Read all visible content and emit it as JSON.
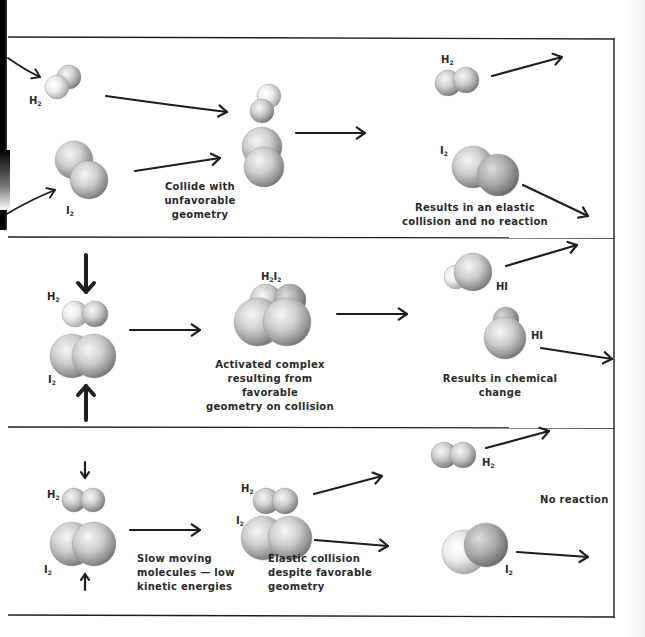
{
  "panels": [
    {
      "id": "unfavorable-geometry",
      "reactants": [
        "H2",
        "I2"
      ],
      "collision_caption": "Collide with\nunfavorable geometry",
      "result_caption": "Results in an elastic\ncollision and no reaction",
      "products": [
        "H2",
        "I2"
      ]
    },
    {
      "id": "favorable-geometry",
      "reactants": [
        "H2",
        "I2"
      ],
      "complex_label": "H2I2",
      "collision_caption": "Activated complex\nresulting from favorable\ngeometry on collision",
      "result_caption": "Results in chemical\nchange",
      "products": [
        "HI",
        "HI"
      ]
    },
    {
      "id": "low-kinetic-energy",
      "reactants": [
        "H2",
        "I2"
      ],
      "approach_caption": "Slow moving\nmolecules — low\nkinetic energies",
      "collision_caption": "Elastic collision\ndespite favorable\ngeometry",
      "result_caption": "No reaction",
      "products": [
        "H2",
        "I2"
      ]
    }
  ],
  "labels": {
    "h2": "H",
    "i2": "I",
    "sub2": "2",
    "hi": "HI"
  },
  "colors": {
    "ink": "#1e1e1e",
    "sphere_light": "#f2f2f2",
    "sphere_dark": "#8a8a8a"
  }
}
